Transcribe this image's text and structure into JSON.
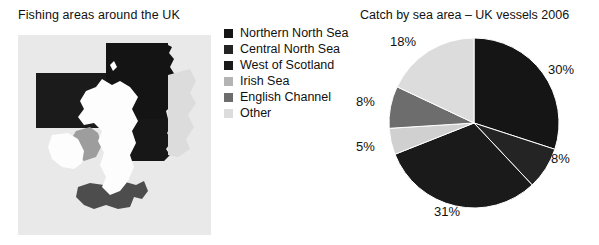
{
  "map_panel": {
    "title": "Fishing areas around the UK",
    "figure_name": "uk-fishing-areas-map",
    "colors": {
      "ocean_background": "#e6e6e6",
      "land": "#fdfdfd",
      "north_sea_dark": "#141414",
      "west_of_scotland_dark": "#1c1c1c",
      "irish_sea_gray": "#9a9a9a",
      "english_channel_gray": "#4a4a4a"
    }
  },
  "legend": {
    "items": [
      {
        "label": "Northern North Sea",
        "color": "#151515",
        "swatch_name": "legend-swatch-northern-north-sea"
      },
      {
        "label": "Central North Sea",
        "color": "#242424",
        "swatch_name": "legend-swatch-central-north-sea"
      },
      {
        "label": "West of Scotland",
        "color": "#1a1a1a",
        "swatch_name": "legend-swatch-west-of-scotland"
      },
      {
        "label": "Irish Sea",
        "color": "#b4b4b4",
        "swatch_name": "legend-swatch-irish-sea"
      },
      {
        "label": "English Channel",
        "color": "#6d6d6d",
        "swatch_name": "legend-swatch-english-channel"
      },
      {
        "label": "Other",
        "color": "#dcdcdc",
        "swatch_name": "legend-swatch-other"
      }
    ]
  },
  "chart_data": {
    "type": "pie",
    "title": "Catch by sea area – UK vessels 2006",
    "xlabel": "",
    "ylabel": "",
    "legend_position": "left",
    "grid": false,
    "units": "percent",
    "categories": [
      "Northern North Sea",
      "Central North Sea",
      "West of Scotland",
      "Irish Sea",
      "English Channel",
      "Other"
    ],
    "values": [
      30,
      8,
      31,
      5,
      8,
      18
    ],
    "labels": [
      "30%",
      "8%",
      "31%",
      "5%",
      "8%",
      "18%"
    ],
    "colors": [
      "#151515",
      "#242424",
      "#1a1a1a",
      "#d0d0d0",
      "#6d6d6d",
      "#dcdcdc"
    ],
    "slices": [
      {
        "name": "Northern North Sea",
        "value": 30,
        "label": "30%",
        "color": "#151515",
        "label_x": 196,
        "label_y": 74
      },
      {
        "name": "Central North Sea",
        "value": 8,
        "label": "8%",
        "color": "#242424",
        "label_x": 199,
        "label_y": 163
      },
      {
        "name": "West of Scotland",
        "value": 31,
        "label": "31%",
        "color": "#1a1a1a",
        "label_x": 82,
        "label_y": 216
      },
      {
        "name": "Irish Sea",
        "value": 5,
        "label": "5%",
        "color": "#d0d0d0",
        "label_x": 4,
        "label_y": 151
      },
      {
        "name": "English Channel",
        "value": 8,
        "label": "8%",
        "color": "#6d6d6d",
        "label_x": 4,
        "label_y": 106
      },
      {
        "name": "Other",
        "value": 18,
        "label": "18%",
        "color": "#dcdcdc",
        "label_x": 38,
        "label_y": 46
      }
    ],
    "start_angle_deg": 0,
    "direction": "clockwise",
    "center": {
      "x": 122,
      "y": 123
    },
    "radius": 85
  }
}
